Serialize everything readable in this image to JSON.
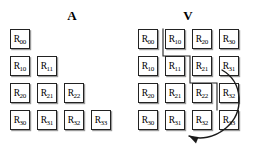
{
  "figure": {
    "background_color": "#ffffff",
    "line_color": "#222222",
    "shadow_color": "#9a9a9a"
  },
  "panels": {
    "left": {
      "title": "A",
      "title_x": 62,
      "title_y": 9,
      "description": "lower triangular packed matrix A",
      "origin_x": 10,
      "origin_y": 29,
      "step_x": 27,
      "step_y": 27,
      "rows": [
        {
          "cells": [
            {
              "base": "R",
              "sub": "00",
              "col": 0
            }
          ]
        },
        {
          "cells": [
            {
              "base": "R",
              "sub": "10",
              "col": 0
            },
            {
              "base": "R",
              "sub": "11",
              "col": 1
            }
          ]
        },
        {
          "cells": [
            {
              "base": "R",
              "sub": "20",
              "col": 0
            },
            {
              "base": "R",
              "sub": "21",
              "col": 1
            },
            {
              "base": "R",
              "sub": "22",
              "col": 2
            }
          ]
        },
        {
          "cells": [
            {
              "base": "R",
              "sub": "30",
              "col": 0
            },
            {
              "base": "R",
              "sub": "31",
              "col": 1
            },
            {
              "base": "R",
              "sub": "32",
              "col": 2
            },
            {
              "base": "R",
              "sub": "33",
              "col": 3
            }
          ]
        }
      ]
    },
    "right": {
      "title": "V",
      "title_x": 178,
      "title_y": 9,
      "description": "full 4x4 rectangular storage V holding the folded triangle",
      "origin_x": 138,
      "origin_y": 29,
      "step_x": 27,
      "step_y": 27,
      "rows": [
        {
          "cells": [
            {
              "base": "R",
              "sub": "00",
              "col": 0
            },
            {
              "base": "R",
              "sub": "10",
              "col": 1
            },
            {
              "base": "R",
              "sub": "20",
              "col": 2
            },
            {
              "base": "R",
              "sub": "30",
              "col": 3
            }
          ]
        },
        {
          "cells": [
            {
              "base": "R",
              "sub": "10",
              "col": 0
            },
            {
              "base": "R",
              "sub": "11",
              "col": 1
            },
            {
              "base": "R",
              "sub": "21",
              "col": 2
            },
            {
              "base": "R",
              "sub": "31",
              "col": 3
            }
          ]
        },
        {
          "cells": [
            {
              "base": "R",
              "sub": "20",
              "col": 0
            },
            {
              "base": "R",
              "sub": "21",
              "col": 1
            },
            {
              "base": "R",
              "sub": "22",
              "col": 2
            },
            {
              "base": "R",
              "sub": "32",
              "col": 3
            }
          ]
        },
        {
          "cells": [
            {
              "base": "R",
              "sub": "30",
              "col": 0
            },
            {
              "base": "R",
              "sub": "31",
              "col": 1
            },
            {
              "base": "R",
              "sub": "32",
              "col": 2
            },
            {
              "base": "R",
              "sub": "33",
              "col": 3
            }
          ]
        }
      ]
    }
  },
  "annotations": {
    "staircase": {
      "name": "staircase-boundary",
      "description": "stepped line separating folded entries from the original triangle in V",
      "points": "163,29 163,56 190,56 190,83 217,83 217,110"
    },
    "wrap_arrow": {
      "name": "wrap-arrow",
      "description": "curved arrow indicating the folded block wraps to the bottom-left",
      "path": "M 222,70 C 243,82 245,112 226,128 C 214,138 200,140 189,136",
      "arrow_tip": "189,136"
    }
  }
}
